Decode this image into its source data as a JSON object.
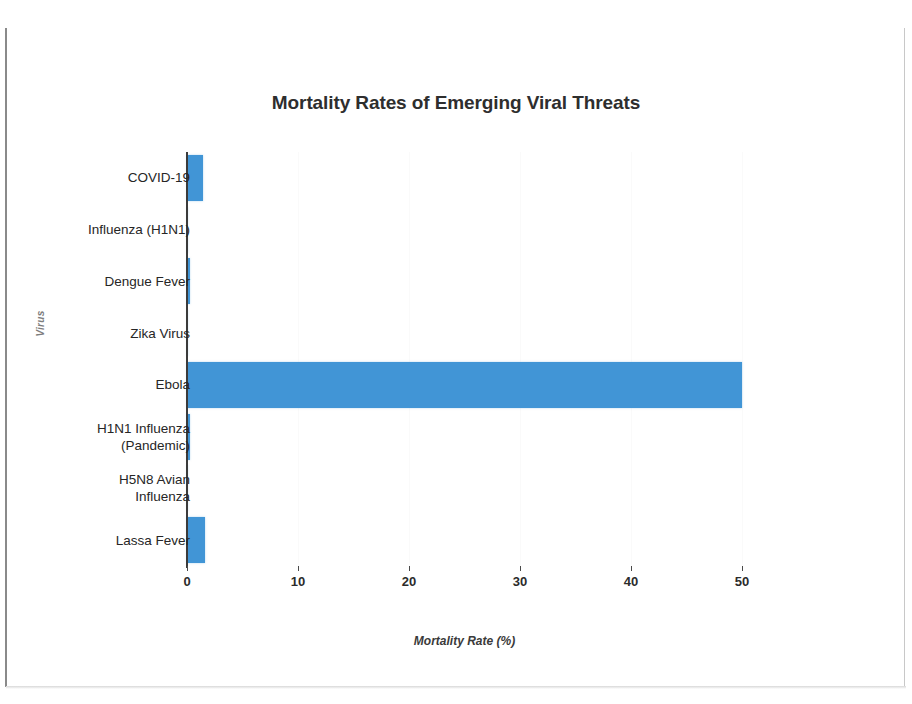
{
  "chart_data": {
    "type": "bar",
    "orientation": "horizontal",
    "title": "Mortality Rates of Emerging Viral Threats",
    "xlabel": "Mortality Rate (%)",
    "ylabel": "Virus",
    "categories": [
      "COVID-19",
      "Influenza (H1N1)",
      "Dengue Fever",
      "Zika Virus",
      "Ebola",
      "H1N1 Influenza (Pandemic)",
      "H5N8 Avian Influenza",
      "Lassa Fever"
    ],
    "values": [
      1.4,
      0.1,
      0.25,
      0.02,
      50,
      0.3,
      0.03,
      1.6
    ],
    "xlim": [
      0,
      50
    ],
    "xticks": [
      0,
      10,
      20,
      30,
      40,
      50
    ],
    "xtick_labels": [
      "0",
      "10",
      "20",
      "30",
      "40",
      "50"
    ],
    "grid": true,
    "legend": false,
    "bar_color": "#4195d6"
  },
  "category_label_lines": [
    [
      "COVID-19"
    ],
    [
      "Influenza (H1N1)"
    ],
    [
      "Dengue Fever"
    ],
    [
      "Zika Virus"
    ],
    [
      "Ebola"
    ],
    [
      "H1N1 Influenza",
      "(Pandemic)"
    ],
    [
      "H5N8 Avian",
      "Influenza"
    ],
    [
      "Lassa Fever"
    ]
  ]
}
